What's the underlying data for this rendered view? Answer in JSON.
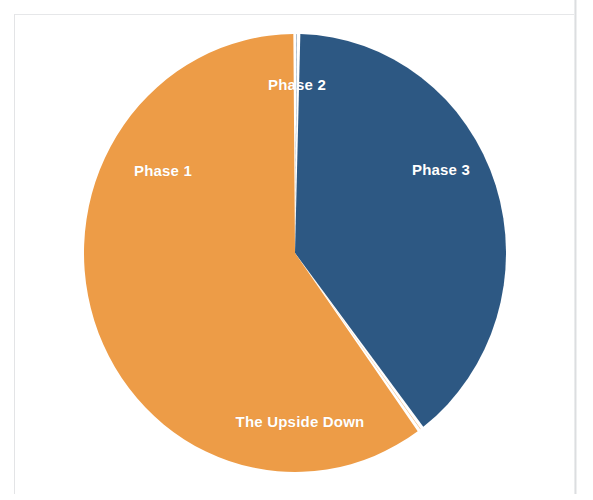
{
  "figure": {
    "background_color": "#ffffff",
    "frame_color": "#e3e4e6"
  },
  "chart_data": {
    "type": "pie",
    "title": "",
    "subtitle": "",
    "xlabel": "",
    "ylabel": "",
    "grid": false,
    "legend_position": "none",
    "labels_inside_slices": true,
    "start_angle_deg": 0,
    "direction": "clockwise",
    "categories": [
      "Phase 2",
      "Phase 3",
      "The Upside Down",
      "Phase 1"
    ],
    "values": [
      0.3,
      39.5,
      0.3,
      59.9
    ],
    "percentages": [
      "0%",
      "40%",
      "0%",
      "60%"
    ],
    "colors": [
      "#2d5883",
      "#2d5883",
      "#ed9c47",
      "#ed9c47"
    ],
    "slices": [
      {
        "label": "Phase 2",
        "value": 0.3,
        "percent": "0%",
        "color": "#2d5883",
        "start_angle_deg": 0,
        "end_angle_deg": 1,
        "label_color": "#ffffff"
      },
      {
        "label": "Phase 3",
        "value": 39.5,
        "percent": "40%",
        "color": "#2d5883",
        "start_angle_deg": 1,
        "end_angle_deg": 143,
        "label_color": "#ffffff"
      },
      {
        "label": "The Upside Down",
        "value": 0.3,
        "percent": "0%",
        "color": "#ed9c47",
        "start_angle_deg": 143,
        "end_angle_deg": 144,
        "label_color": "#ffffff"
      },
      {
        "label": "Phase 1",
        "value": 59.9,
        "percent": "60%",
        "color": "#ed9c47",
        "start_angle_deg": 144,
        "end_angle_deg": 360,
        "label_color": "#ffffff"
      }
    ],
    "series_colors": {
      "orange": "#ed9c47",
      "blue": "#2d5883",
      "slice_gap": "#ffffff"
    }
  },
  "labels": {
    "phase_1": "Phase 1",
    "phase_2": "Phase 2",
    "phase_3": "Phase 3",
    "upside_down": "The Upside Down"
  }
}
